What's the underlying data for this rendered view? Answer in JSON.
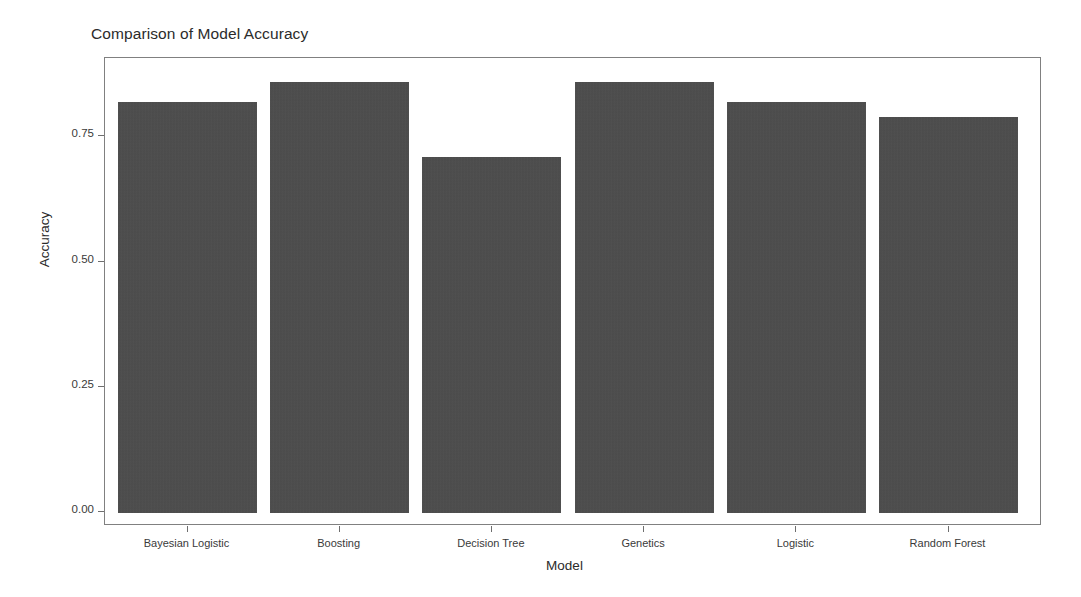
{
  "chart_data": {
    "type": "bar",
    "title": "Comparison of Model Accuracy",
    "xlabel": "Model",
    "ylabel": "Accuracy",
    "categories": [
      "Bayesian Logistic",
      "Boosting",
      "Decision Tree",
      "Genetics",
      "Logistic",
      "Random Forest"
    ],
    "values": [
      0.82,
      0.86,
      0.71,
      0.86,
      0.82,
      0.79
    ],
    "ylim": [
      0.0,
      0.9
    ],
    "ytick_labels": [
      "0.00",
      "0.25",
      "0.50",
      "0.75"
    ],
    "ytick_values": [
      0.0,
      0.25,
      0.5,
      0.75
    ],
    "grid": false,
    "legend": null,
    "bar_color": "#4b4b4b",
    "panel_border_color": "#808080",
    "background_color": "#ffffff"
  },
  "figure": {
    "title": "Comparison of Model Accuracy",
    "x_axis_title": "Model",
    "y_axis_title": "Accuracy"
  }
}
